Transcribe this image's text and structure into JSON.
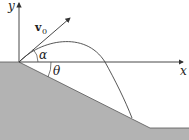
{
  "figure": {
    "labels": {
      "y_axis": "y",
      "x_axis": "x",
      "velocity": "v",
      "velocity_sub": "0",
      "launch_angle": "α",
      "incline_angle": "θ"
    },
    "colors": {
      "ground_fill": "#b3b3b3",
      "line": "#333333",
      "background": "#ffffff"
    }
  }
}
